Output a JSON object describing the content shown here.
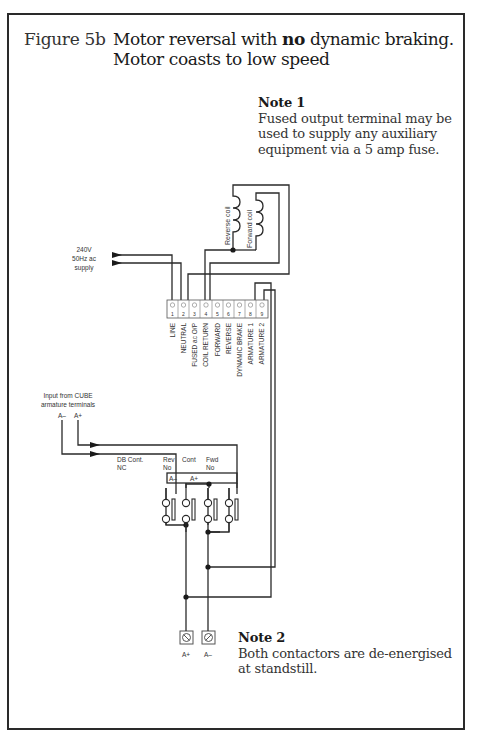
{
  "figure": {
    "label": "Figure 5b",
    "title_prefix": "Motor reversal with ",
    "title_bold": "no",
    "title_suffix": " dynamic braking.",
    "title_line2": "Motor coasts to low speed"
  },
  "notes": [
    {
      "heading": "Note 1",
      "text": "Fused output terminal may be used to supply any auxiliary equipment via a 5 amp fuse."
    },
    {
      "heading": "Note 2",
      "text": "Both contactors are de-energised at standstill."
    }
  ],
  "supply": {
    "line1": "240V",
    "line2": "50Hz ac",
    "line3": "supply"
  },
  "coils": {
    "reverse": "Reverse coil",
    "forward": "Forward coil"
  },
  "terminals": [
    {
      "num": "1",
      "label": "LINE"
    },
    {
      "num": "2",
      "label": "NEUTRAL"
    },
    {
      "num": "3",
      "label": "FUSED ac O/P"
    },
    {
      "num": "4",
      "label": "COIL RETURN"
    },
    {
      "num": "5",
      "label": "FORWARD"
    },
    {
      "num": "6",
      "label": "REVERSE"
    },
    {
      "num": "7",
      "label": "DYNAMIC BRAKE"
    },
    {
      "num": "8",
      "label": "ARMATURE 1"
    },
    {
      "num": "9",
      "label": "ARMATURE 2"
    }
  ],
  "input": {
    "line1": "Input from CUBE",
    "line2": "armature terminals",
    "a_minus": "A–",
    "a_plus": "A+"
  },
  "contactors": {
    "db_line1": "DB  Cont.",
    "db_line2": "NC",
    "rev_line1": "Rev",
    "rev_line2": "No",
    "cont": "Cont",
    "fwd_line1": "Fwd",
    "fwd_line2": "No",
    "a_minus": "A–",
    "a_plus": "A+"
  },
  "motor_terminals": {
    "a_plus": "A+",
    "a_minus": "A–"
  }
}
